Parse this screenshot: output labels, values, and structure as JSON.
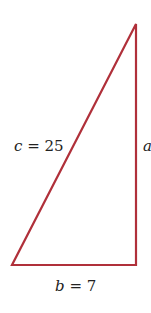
{
  "diagram": {
    "type": "right-triangle",
    "stroke_color": "#b0303a",
    "labels": {
      "hypotenuse_var": "c",
      "hypotenuse_eq": " = 25",
      "vertical_var": "a",
      "base_var": "b",
      "base_eq": " = 7"
    }
  }
}
